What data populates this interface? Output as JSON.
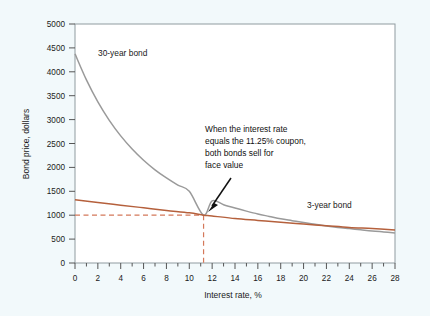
{
  "chart_data": {
    "type": "line",
    "title": "",
    "xlabel": "Interest rate, %",
    "ylabel": "Bond price, dollars",
    "xlim": [
      0,
      28
    ],
    "ylim": [
      0,
      5000
    ],
    "grid": false,
    "legend_position": "inline-labels",
    "xticks": [
      0,
      2,
      4,
      6,
      8,
      10,
      12,
      14,
      16,
      18,
      20,
      22,
      24,
      26,
      28
    ],
    "xtick_labels": [
      "0",
      "2",
      "4",
      "6",
      "8",
      "10",
      "12",
      "14",
      "16",
      "18",
      "20",
      "22",
      "24",
      "26",
      "28"
    ],
    "xminor_ticks": [
      1,
      3,
      5,
      7,
      9,
      11,
      13,
      15,
      17,
      19,
      21,
      23,
      25,
      27
    ],
    "yticks": [
      0,
      500,
      1000,
      1500,
      2000,
      2500,
      3000,
      3500,
      4000,
      4500,
      5000
    ],
    "ytick_labels": [
      "0",
      "500",
      "1000",
      "1500",
      "2000",
      "2500",
      "3000",
      "3500",
      "4000",
      "4500",
      "5000"
    ],
    "series": [
      {
        "name": "30-year bond",
        "color": "#9a9a9a",
        "label_text": "30-year bond",
        "x": [
          0,
          1,
          2,
          3,
          4,
          5,
          6,
          7,
          8,
          9,
          10,
          11.25,
          12,
          13,
          14,
          15,
          16,
          17,
          18,
          19,
          20,
          21,
          22,
          23,
          24,
          25,
          26,
          27,
          28
        ],
        "values": [
          4375,
          3830,
          3370,
          2985,
          2660,
          2385,
          2150,
          1950,
          1780,
          1630,
          1500,
          1000,
          1300,
          1220,
          1150,
          1085,
          1025,
          975,
          925,
          885,
          845,
          810,
          775,
          745,
          720,
          695,
          670,
          650,
          630
        ]
      },
      {
        "name": "3-year bond",
        "color": "#b5603c",
        "label_text": "3-year bond",
        "x": [
          0,
          2,
          4,
          6,
          8,
          10,
          11.25,
          12,
          14,
          16,
          18,
          20,
          22,
          24,
          26,
          28
        ],
        "values": [
          1325,
          1265,
          1210,
          1155,
          1100,
          1050,
          1000,
          985,
          930,
          890,
          850,
          815,
          780,
          745,
          720,
          690
        ]
      }
    ],
    "reference_lines": {
      "color": "#d4785a",
      "horizontal_value": 1000,
      "vertical_value": 11.25,
      "style": "dashed"
    },
    "annotation": {
      "lines": [
        "When the interest rate",
        "equals the 11.25% coupon,",
        "both bonds sell for",
        "face value"
      ],
      "arrow_target_x": 11.25,
      "arrow_target_y": 1000
    }
  },
  "colors": {
    "background": "#f2f9fb",
    "plot_background": "#ffffff",
    "axis": "#555555",
    "series_30yr": "#9a9a9a",
    "series_3yr": "#b5603c",
    "reference": "#d4785a",
    "text": "#1a1a1a"
  }
}
